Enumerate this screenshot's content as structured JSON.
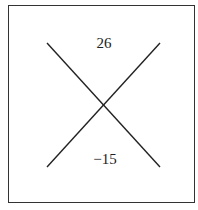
{
  "diagram": {
    "type": "x-factor-box",
    "top_value": "26",
    "bottom_value": "−15",
    "line_color": "#222222",
    "border_color": "#333333"
  }
}
